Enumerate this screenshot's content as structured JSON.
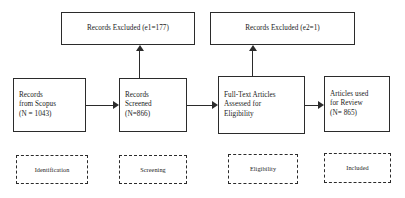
{
  "diagram": {
    "accent_color": "#2b2b2b",
    "background_color": "#ffffff"
  },
  "excluded_boxes": [
    {
      "label": "Records Excluded (e1=177)"
    },
    {
      "label": "Records Excluded (e2=1)"
    }
  ],
  "flow_boxes": [
    {
      "line1": "Records",
      "line2": "from Scopus",
      "line3": "(N = 1043)"
    },
    {
      "line1": "Records",
      "line2": "Screened",
      "line3": "(N=866)"
    },
    {
      "line1": "Full-Text Articles",
      "line2": "Assessed for",
      "line3": "Eligibility"
    },
    {
      "line1": "Articles used",
      "line2": "for Review",
      "line3": "(N= 865)"
    }
  ],
  "stage_labels": [
    {
      "label": "Identification"
    },
    {
      "label": "Screening"
    },
    {
      "label": "Eligibility"
    },
    {
      "label": "Included"
    }
  ]
}
